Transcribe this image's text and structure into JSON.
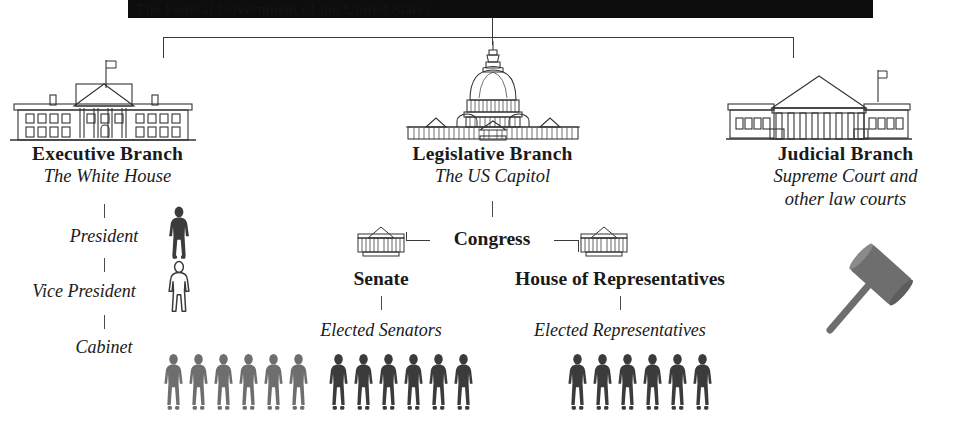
{
  "diagram": {
    "title_bar": {
      "name": "redacted-title-bar",
      "text": "The Federal Government of the United States"
    },
    "branches": [
      {
        "id": "executive",
        "title": "Executive Branch",
        "subtitle": "The White House",
        "icon": "white-house-icon",
        "roles": [
          {
            "id": "president",
            "label": "President",
            "figure_style": "solid-dark",
            "figure_count": 1
          },
          {
            "id": "vice-president",
            "label": "Vice President",
            "figure_style": "outline",
            "figure_count": 1
          },
          {
            "id": "cabinet",
            "label": "Cabinet",
            "figure_style": "solid-gray",
            "figure_count": 6
          }
        ]
      },
      {
        "id": "legislative",
        "title": "Legislative Branch",
        "subtitle": "The US Capitol",
        "icon": "us-capitol-icon",
        "node": {
          "id": "congress",
          "label": "Congress"
        },
        "chambers": [
          {
            "id": "senate",
            "label": "Senate",
            "icon": "senate-building-icon",
            "members_label": "Elected Senators",
            "figure_style": "solid-dark",
            "figure_count": 6
          },
          {
            "id": "house-of-representatives",
            "label": "House of Representatives",
            "icon": "house-building-icon",
            "members_label": "Elected Representatives",
            "figure_style": "solid-dark",
            "figure_count": 6
          }
        ]
      },
      {
        "id": "judicial",
        "title": "Judicial Branch",
        "subtitle_line1": "Supreme Court and",
        "subtitle_line2": "other law courts",
        "icon": "supreme-court-icon",
        "symbol": {
          "id": "gavel",
          "icon": "gavel-icon"
        }
      }
    ],
    "colors": {
      "ink": "#1a1a1a",
      "line": "#3a3a3a",
      "figure_dark": "#3b3b3b",
      "figure_gray": "#6e6e6e",
      "figure_outline_stroke": "#3b3b3b",
      "figure_outline_fill": "#ffffff",
      "gavel": "#6e6e6e",
      "title_bar_bg": "#0d0d0d",
      "background": "#ffffff"
    }
  }
}
